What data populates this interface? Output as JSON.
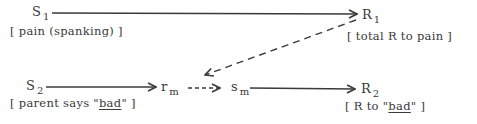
{
  "diagram": {
    "nodes": {
      "s1": {
        "symbol": "S",
        "sub": "1",
        "label_pre": "[ pain  (spanking) ]",
        "label_u": "",
        "label_post": ""
      },
      "r1": {
        "symbol": "R",
        "sub": "1",
        "label_pre": "[ total R to pain ]",
        "label_u": "",
        "label_post": ""
      },
      "s2": {
        "symbol": "S",
        "sub": "2",
        "label_pre": "[ parent says \"",
        "label_u": "bad",
        "label_post": "\"  ]"
      },
      "rm": {
        "symbol": "r",
        "sub": "m"
      },
      "sm": {
        "symbol": "s",
        "sub": "m"
      },
      "r2": {
        "symbol": "R",
        "sub": "2",
        "label_pre": "[ R to \"",
        "label_u": "bad",
        "label_post": "\"  ]"
      }
    },
    "edges": [
      {
        "from": "S1",
        "to": "R1",
        "style": "solid"
      },
      {
        "from": "R1",
        "to": "rm",
        "style": "dashed"
      },
      {
        "from": "S2",
        "to": "rm",
        "style": "solid"
      },
      {
        "from": "rm",
        "to": "sm",
        "style": "dashed"
      },
      {
        "from": "sm",
        "to": "R2",
        "style": "solid"
      }
    ],
    "colors": {
      "ink": "#3a3a3a",
      "background": "#ffffff"
    }
  }
}
